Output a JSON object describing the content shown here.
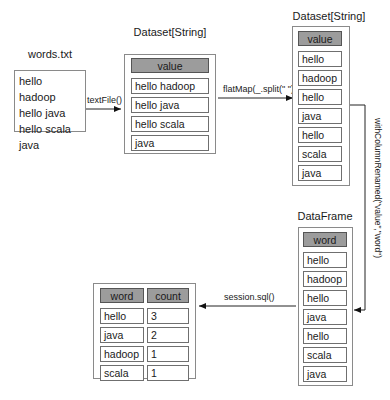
{
  "source_file": {
    "title": "words.txt",
    "lines": [
      "hello hadoop",
      "hello java",
      "hello scala",
      "java"
    ]
  },
  "dataset1": {
    "title": "Dataset[String]",
    "header": "value",
    "rows": [
      "hello hadoop",
      "hello java",
      "hello scala",
      "java"
    ]
  },
  "dataset2": {
    "title": "Dataset[String]",
    "header": "value",
    "rows": [
      "hello",
      "hadoop",
      "hello",
      "java",
      "hello",
      "scala",
      "java"
    ]
  },
  "dataframe": {
    "title": "DataFrame",
    "header": "word",
    "rows": [
      "hello",
      "hadoop",
      "hello",
      "java",
      "hello",
      "scala",
      "java"
    ]
  },
  "result": {
    "headers": [
      "word",
      "count"
    ],
    "rows": [
      [
        "hello",
        "3"
      ],
      [
        "java",
        "2"
      ],
      [
        "hadoop",
        "1"
      ],
      [
        "scala",
        "1"
      ]
    ]
  },
  "edges": {
    "textfile": "textFile()",
    "flatmap": "flatMap(_.split(\" \"))",
    "rename": "withColumnRenamed(\"value\",\"word\")",
    "sql": "session.sql()"
  },
  "colors": {
    "header_fill": "#9c9c9c",
    "border": "#6f6f6f",
    "background": "#ffffff"
  }
}
